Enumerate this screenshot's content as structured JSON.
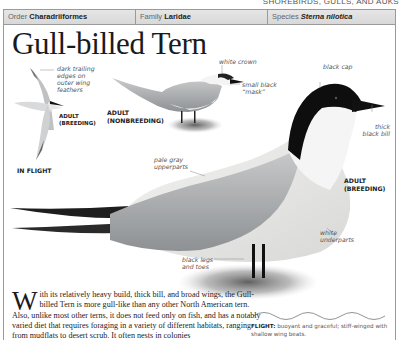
{
  "running_head": "SHOREBIRDS, GULLS, AND AUKS",
  "taxonomy": {
    "order_label": "Order",
    "order_value": "Charadriiformes",
    "family_label": "Family",
    "family_value": "Laridae",
    "species_label": "Species",
    "species_value": "Sterna nilotica"
  },
  "title": "Gull-billed Tern",
  "illustrations": {
    "in_flight": {
      "callout": [
        "dark trailing",
        "edges on",
        "outer wing",
        "feathers"
      ],
      "label_line1": "ADULT",
      "label_line2": "(BREEDING)",
      "caption": "IN FLIGHT"
    },
    "nonbreeding": {
      "label_line1": "ADULT",
      "label_line2": "(NONBREEDING)",
      "callouts": {
        "crown": "white crown",
        "mask_line1": "small black",
        "mask_line2": "“mask”"
      }
    },
    "breeding": {
      "label_line1": "ADULT",
      "label_line2": "(BREEDING)",
      "callouts": {
        "cap": "black cap",
        "bill_line1": "thick",
        "bill_line2": "black bill",
        "upper_line1": "pale gray",
        "upper_line2": "upperparts",
        "under_line1": "white",
        "under_line2": "underparts",
        "legs_line1": "black legs",
        "legs_line2": "and toes"
      }
    }
  },
  "description": {
    "dropcap": "W",
    "text": "ith its relatively heavy build, thick bill, and broad wings, the Gull-billed Tern is more gull-like than any other North American tern. Also, unlike most other terns, it does not feed only on fish, and has a notably varied diet that requires foraging in a variety of different habitats, ranging from mudflats to desert scrub. It often nests in colonies"
  },
  "flight": {
    "label": "FLIGHT:",
    "text": " buoyant and graceful; stiff-winged with shallow wing beats."
  },
  "colors": {
    "frame": "#9a9a9a",
    "bar": "#dcdcdc",
    "black_cap": "#111111",
    "pale_gray": "#b9bcbf"
  }
}
